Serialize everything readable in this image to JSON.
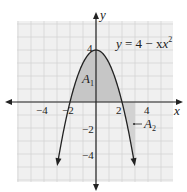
{
  "chart_data": {
    "type": "line",
    "title": "",
    "function_label": "y = 4 − x²",
    "xlabel": "x",
    "ylabel": "y",
    "xlim": [
      -6,
      6
    ],
    "ylim": [
      -6,
      6
    ],
    "grid": true,
    "x_ticks": [
      {
        "value": -4,
        "label": "−4"
      },
      {
        "value": -2,
        "label": "−2"
      },
      {
        "value": 2,
        "label": "2"
      },
      {
        "value": 4,
        "label": "4"
      }
    ],
    "y_ticks": [
      {
        "value": 4,
        "label": "4"
      },
      {
        "value": -2,
        "label": "−2"
      },
      {
        "value": -4,
        "label": "−4"
      }
    ],
    "series": [
      {
        "name": "y = 4 − x²",
        "x": [
          -3.1,
          -3,
          -2,
          -1,
          0,
          1,
          2,
          3,
          3.1
        ],
        "values": [
          -5.61,
          -5,
          0,
          3,
          4,
          3,
          0,
          -5,
          -5.61
        ]
      }
    ],
    "shaded_regions": [
      {
        "name": "A1",
        "label": "A",
        "subscript": "1",
        "description": "area under curve above x-axis, from x=-2 to x=2"
      },
      {
        "name": "A2",
        "label": "A",
        "subscript": "2",
        "description": "area between curve and x-axis below x-axis, from x=2 to x=3"
      }
    ],
    "annotations": [
      {
        "text": "A1",
        "x": -0.5,
        "y": 1.5
      },
      {
        "text": "A2",
        "x": 3.9,
        "y": -1.8
      }
    ],
    "colors": {
      "grid": "#d6d6d6",
      "background": "#f0f0f0",
      "shade": "#c8c8c8",
      "curve": "#222222",
      "axis": "#222222"
    }
  },
  "labels": {
    "x_axis": "x",
    "y_axis": "y",
    "func_y": "y",
    "func_eq": " = 4 − x",
    "func_exp": "2",
    "a1_main": "A",
    "a1_sub": "1",
    "a2_main": "A",
    "a2_sub": "2",
    "tick_xm4": "−4",
    "tick_xm2": "−2",
    "tick_x2": "2",
    "tick_x4": "4",
    "tick_y4": "4",
    "tick_ym2": "−2",
    "tick_ym4": "−4"
  }
}
